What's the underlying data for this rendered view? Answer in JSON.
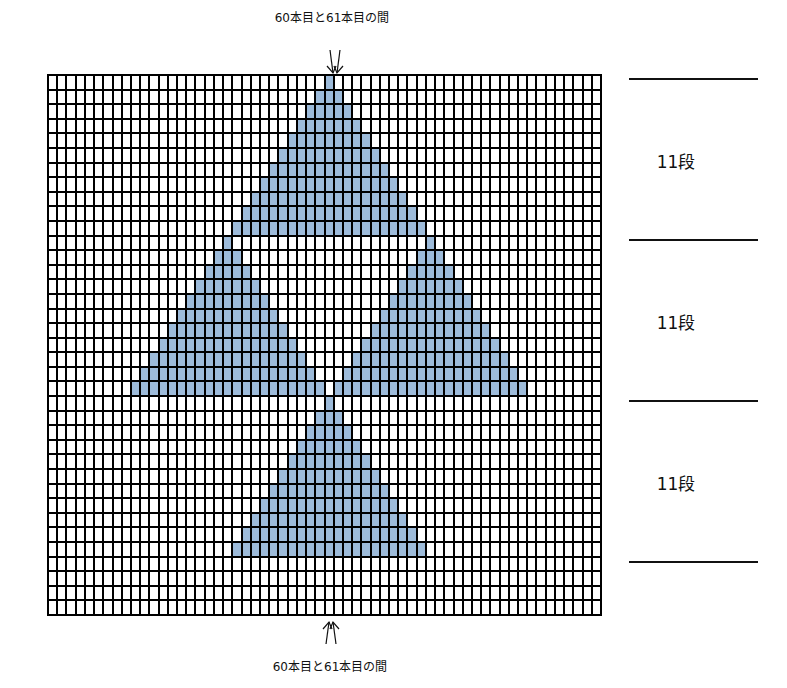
{
  "top_label": {
    "text": "60本目と61本目の間"
  },
  "bottom_label": {
    "text": "60本目と61本目の間"
  },
  "chart": {
    "columns": 60,
    "rows": 37,
    "fill_color": "#9dbbda",
    "line_color": "#000000",
    "center_between_columns": [
      60,
      61
    ],
    "triangles": [
      {
        "name": "top",
        "apex_row": 0,
        "apex_col": 30,
        "height_rows": 11
      },
      {
        "name": "left",
        "apex_row": 11,
        "apex_col": 19,
        "height_rows": 11
      },
      {
        "name": "right",
        "apex_row": 11,
        "apex_col": 41,
        "height_rows": 11
      },
      {
        "name": "bottom",
        "apex_row": 22,
        "apex_col": 30,
        "height_rows": 11
      }
    ]
  },
  "sections": [
    {
      "label": "11段",
      "y_top": 79,
      "y_bottom": 240
    },
    {
      "label": "11段",
      "y_top": 240,
      "y_bottom": 401
    },
    {
      "label": "11段",
      "y_top": 401,
      "y_bottom": 562
    }
  ],
  "rules_y": [
    79,
    240,
    401,
    562
  ]
}
